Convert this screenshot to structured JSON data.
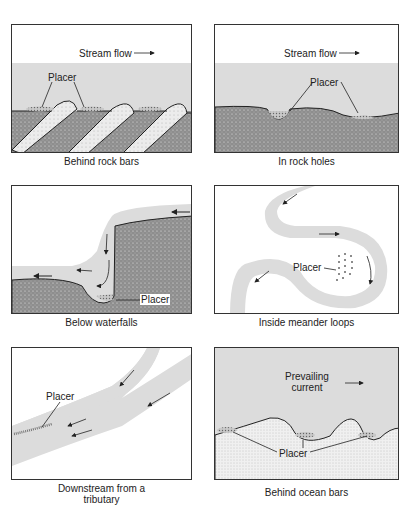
{
  "figure": {
    "colors": {
      "water": "#dcdcdc",
      "rock": "#9a9a9a",
      "bar": "#e6e6e6",
      "sand": "#ececec",
      "outline": "#222222"
    },
    "panels": [
      {
        "id": "rock-bars",
        "caption": "Behind rock bars",
        "labels": {
          "flow": "Stream flow",
          "placer": "Placer"
        }
      },
      {
        "id": "rock-holes",
        "caption": "In rock holes",
        "labels": {
          "flow": "Stream flow",
          "placer": "Placer"
        }
      },
      {
        "id": "waterfalls",
        "caption": "Below waterfalls",
        "labels": {
          "placer": "Placer"
        }
      },
      {
        "id": "meander",
        "caption": "Inside meander loops",
        "labels": {
          "placer": "Placer"
        }
      },
      {
        "id": "tributary",
        "caption_line1": "Downstream from a",
        "caption_line2": "tributary",
        "labels": {
          "placer": "Placer"
        }
      },
      {
        "id": "ocean-bars",
        "caption": "Behind ocean bars",
        "labels": {
          "current_line1": "Prevailing",
          "current_line2": "current",
          "placer": "Placer"
        }
      }
    ]
  }
}
